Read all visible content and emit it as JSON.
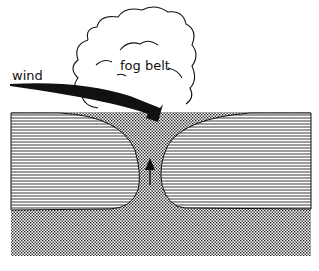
{
  "diagram": {
    "labels": {
      "wind": "wind",
      "fog_belt": "fog belt"
    },
    "elements": {
      "cloud": "fog belt cloud outline",
      "wind_arrow": "curved wind arrow descending into the gap",
      "left_water": "horizontally hatched region (left)",
      "right_water": "horizontally hatched region (right)",
      "stippled_region": "dotted region (valley / gap and base)",
      "up_arrow": "upward arrow in the gap"
    },
    "colors": {
      "ink": "#111111",
      "background": "#ffffff"
    }
  }
}
